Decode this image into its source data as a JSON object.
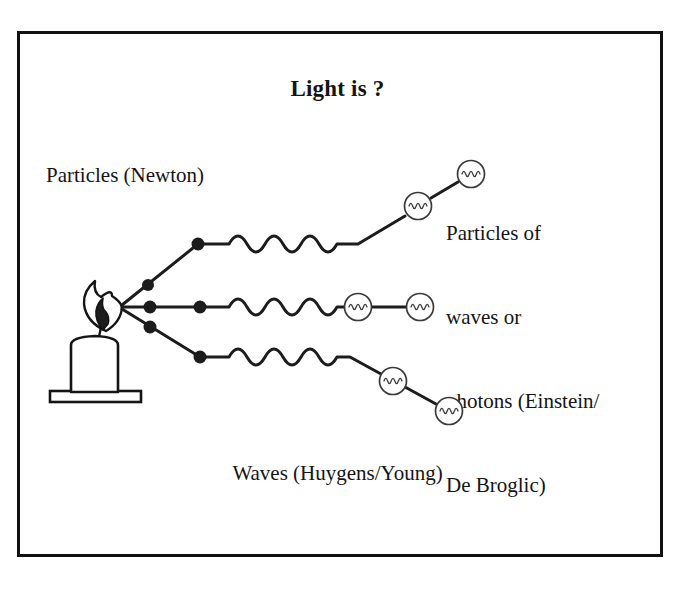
{
  "slide": {
    "title": "Light is ?",
    "frame_color": "#111111",
    "background": "#ffffff",
    "ink_color": "#141414"
  },
  "labels": {
    "top_left": "Particles (Newton)",
    "bottom_center": "Waves (Huygens/Young)",
    "right_block": [
      "Particles of",
      "waves or",
      "photons (Einstein/",
      "De Broglic)"
    ]
  },
  "diagram": {
    "source": {
      "name": "candle",
      "flame_tip_x": 122,
      "flame_tip_y": 307
    },
    "ray_count": 3,
    "dots_per_ray": 2,
    "circles_per_ray": 2,
    "wave_cycles": 3,
    "rays": [
      {
        "name": "upper-ray",
        "end_y": 205
      },
      {
        "name": "middle-ray",
        "end_y": 307
      },
      {
        "name": "lower-ray",
        "end_y": 395
      }
    ]
  }
}
